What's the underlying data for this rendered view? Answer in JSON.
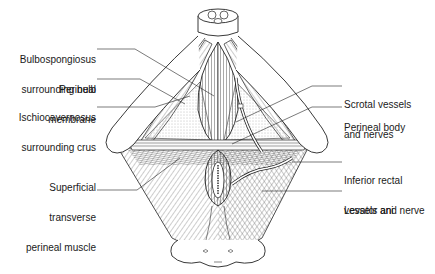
{
  "figure": {
    "stroke_color": "#222222",
    "fill_muscle": "#f4f4f4",
    "fill_membrane": "#e8e8e8"
  },
  "labels": {
    "left": [
      {
        "id": "bulbospongiosus",
        "line1": "Bulbospongiosus",
        "line2": "surrounding bulb"
      },
      {
        "id": "perineal-membrane",
        "line1": "Perineal",
        "line2": "membrane"
      },
      {
        "id": "ischiocavernosus",
        "line1": "Ischiocavernosus",
        "line2": "surrounding crus"
      },
      {
        "id": "superficial-transverse",
        "line1": "Superficial",
        "line2": "transverse",
        "line3": "perineal muscle"
      }
    ],
    "right": [
      {
        "id": "scrotal-vessels",
        "line1": "Scrotal vessels",
        "line2": "and nerves"
      },
      {
        "id": "perineal-body",
        "line1": "Perineal body"
      },
      {
        "id": "inferior-rectal",
        "line1": "Inferior rectal",
        "line2": "vessels and nerve"
      },
      {
        "id": "levator-ani",
        "line1": "Levator ani"
      }
    ]
  }
}
